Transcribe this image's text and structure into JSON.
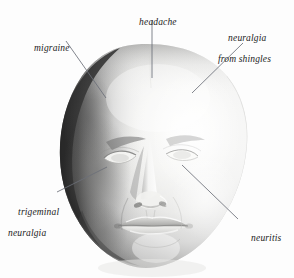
{
  "figure": {
    "type": "anatomical-illustration",
    "background_color": "#fdfdfd",
    "label_text_color": "#1b1b1b",
    "leader_line_color": "#6b6f78"
  },
  "labels": [
    {
      "id": "headache",
      "line1": "headache",
      "line2": "",
      "align": "center",
      "text_x": 152,
      "text_y": 11,
      "leader": {
        "x1": 152,
        "y1": 20,
        "x2": 152,
        "y2": 78
      },
      "points_to": "forehead / crown"
    },
    {
      "id": "migraine",
      "line1": "migraine",
      "line2": "",
      "align": "left",
      "text_x": 47,
      "text_y": 37,
      "leader": {
        "x1": 66,
        "y1": 41,
        "x2": 106,
        "y2": 98
      },
      "points_to": "left temple"
    },
    {
      "id": "neuralgia-from-shingles",
      "line1": "neuralgia",
      "line2": "from shingles",
      "align": "left",
      "text_x": 249,
      "text_y": 32,
      "leader": {
        "x1": 243,
        "y1": 43,
        "x2": 192,
        "y2": 93
      },
      "points_to": "right forehead / brow"
    },
    {
      "id": "trigeminal-neuralgia",
      "line1": "trigeminal",
      "line2": "neuralgia",
      "align": "left",
      "text_x": 36,
      "text_y": 206,
      "leader": {
        "x1": 57,
        "y1": 192,
        "x2": 107,
        "y2": 167
      },
      "points_to": "left cheek / jaw"
    },
    {
      "id": "neuritis",
      "line1": "neuritis",
      "line2": "",
      "align": "left",
      "text_x": 262,
      "text_y": 227,
      "leader": {
        "x1": 238,
        "y1": 219,
        "x2": 182,
        "y2": 165
      },
      "points_to": "right cheek below eye"
    }
  ]
}
